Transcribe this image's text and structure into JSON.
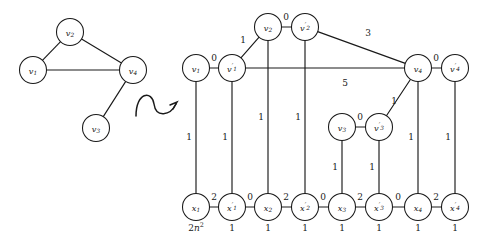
{
  "figure": {
    "background": "#ffffff",
    "ink": "#1a1a1a"
  },
  "left_graph": {
    "name": "original-graph",
    "nodes": [
      {
        "id": "v1",
        "label": "v",
        "sub": "1",
        "cx": 33,
        "cy": 70,
        "r": 13.5
      },
      {
        "id": "v2",
        "label": "v",
        "sub": "2",
        "cx": 70,
        "cy": 32,
        "r": 13.5
      },
      {
        "id": "v3",
        "label": "v",
        "sub": "3",
        "cx": 96,
        "cy": 128,
        "r": 13.5
      },
      {
        "id": "v4",
        "label": "v",
        "sub": "4",
        "cx": 133,
        "cy": 70,
        "r": 13.5
      }
    ],
    "edges": [
      {
        "from": "v1",
        "to": "v2"
      },
      {
        "from": "v2",
        "to": "v4"
      },
      {
        "from": "v1",
        "to": "v4"
      },
      {
        "from": "v3",
        "to": "v4"
      }
    ]
  },
  "arrow": {
    "name": "transformation-arrow",
    "symbol": "squiggly-arrow"
  },
  "right_graph": {
    "name": "gadget-graph",
    "nodes": [
      {
        "id": "v1",
        "label": "v",
        "sub": "1",
        "prime": false,
        "cx": 196,
        "cy": 68,
        "r": 13.5
      },
      {
        "id": "v1p",
        "label": "v",
        "sub": "1",
        "prime": true,
        "cx": 232,
        "cy": 68,
        "r": 13.5
      },
      {
        "id": "v2",
        "label": "v",
        "sub": "2",
        "prime": false,
        "cx": 268,
        "cy": 27,
        "r": 13.5
      },
      {
        "id": "v2p",
        "label": "v",
        "sub": "2",
        "prime": true,
        "cx": 305,
        "cy": 27,
        "r": 13.5
      },
      {
        "id": "v3",
        "label": "v",
        "sub": "3",
        "prime": false,
        "cx": 342,
        "cy": 127,
        "r": 13.5
      },
      {
        "id": "v3p",
        "label": "v",
        "sub": "3",
        "prime": true,
        "cx": 379,
        "cy": 127,
        "r": 13.5
      },
      {
        "id": "v4",
        "label": "v",
        "sub": "4",
        "prime": false,
        "cx": 418,
        "cy": 68,
        "r": 13.5
      },
      {
        "id": "v4p",
        "label": "v",
        "sub": "4",
        "prime": true,
        "cx": 455,
        "cy": 68,
        "r": 13.5
      },
      {
        "id": "x1",
        "label": "x",
        "sub": "1",
        "prime": false,
        "cx": 196,
        "cy": 207,
        "r": 13.5
      },
      {
        "id": "x1p",
        "label": "x",
        "sub": "1",
        "prime": true,
        "cx": 232,
        "cy": 207,
        "r": 13.5
      },
      {
        "id": "x2",
        "label": "x",
        "sub": "2",
        "prime": false,
        "cx": 268,
        "cy": 207,
        "r": 13.5
      },
      {
        "id": "x2p",
        "label": "x",
        "sub": "2",
        "prime": true,
        "cx": 305,
        "cy": 207,
        "r": 13.5
      },
      {
        "id": "x3",
        "label": "x",
        "sub": "3",
        "prime": false,
        "cx": 342,
        "cy": 207,
        "r": 13.5
      },
      {
        "id": "x3p",
        "label": "x",
        "sub": "3",
        "prime": true,
        "cx": 379,
        "cy": 207,
        "r": 13.5
      },
      {
        "id": "x4",
        "label": "x",
        "sub": "4",
        "prime": false,
        "cx": 418,
        "cy": 207,
        "r": 13.5
      },
      {
        "id": "x4p",
        "label": "x",
        "sub": "4",
        "prime": true,
        "cx": 455,
        "cy": 207,
        "r": 13.5
      }
    ],
    "edges": [
      {
        "from": "v1",
        "to": "v1p",
        "weight": "0",
        "lx": 214,
        "ly": 58
      },
      {
        "from": "v2",
        "to": "v2p",
        "weight": "0",
        "lx": 286,
        "ly": 17
      },
      {
        "from": "v3",
        "to": "v3p",
        "weight": "0",
        "lx": 360,
        "ly": 117
      },
      {
        "from": "v4",
        "to": "v4p",
        "weight": "0",
        "lx": 436,
        "ly": 58
      },
      {
        "from": "v1p",
        "to": "v2",
        "weight": "1",
        "lx": 243,
        "ly": 40
      },
      {
        "from": "v2p",
        "to": "v4",
        "weight": "3",
        "lx": 368,
        "ly": 33
      },
      {
        "from": "v1p",
        "to": "v4",
        "weight": "5",
        "lx": 345,
        "ly": 83
      },
      {
        "from": "v3p",
        "to": "v4",
        "weight": "1",
        "lx": 394,
        "ly": 101
      },
      {
        "from": "v1",
        "to": "x1",
        "weight": "1",
        "lx": 189,
        "ly": 137
      },
      {
        "from": "v1p",
        "to": "x1p",
        "weight": "1",
        "lx": 225,
        "ly": 137
      },
      {
        "from": "v2",
        "to": "x2",
        "weight": "1",
        "lx": 261,
        "ly": 117
      },
      {
        "from": "v2p",
        "to": "x2p",
        "weight": "1",
        "lx": 298,
        "ly": 117
      },
      {
        "from": "v3",
        "to": "x3",
        "weight": "1",
        "lx": 335,
        "ly": 167
      },
      {
        "from": "v3p",
        "to": "x3p",
        "weight": "1",
        "lx": 372,
        "ly": 167
      },
      {
        "from": "v4",
        "to": "x4",
        "weight": "1",
        "lx": 411,
        "ly": 137
      },
      {
        "from": "v4p",
        "to": "x4p",
        "weight": "1",
        "lx": 448,
        "ly": 137
      },
      {
        "from": "x1",
        "to": "x1p",
        "weight": "2",
        "lx": 214,
        "ly": 197
      },
      {
        "from": "x1p",
        "to": "x2",
        "weight": "0",
        "lx": 250,
        "ly": 197
      },
      {
        "from": "x2",
        "to": "x2p",
        "weight": "2",
        "lx": 286,
        "ly": 197
      },
      {
        "from": "x2p",
        "to": "x3",
        "weight": "0",
        "lx": 323,
        "ly": 197
      },
      {
        "from": "x3",
        "to": "x3p",
        "weight": "2",
        "lx": 360,
        "ly": 197
      },
      {
        "from": "x3p",
        "to": "x4",
        "weight": "0",
        "lx": 398,
        "ly": 197
      },
      {
        "from": "x4",
        "to": "x4p",
        "weight": "2",
        "lx": 436,
        "ly": 197
      }
    ],
    "node_weights": [
      {
        "node": "x1",
        "value": "2n^2",
        "display": "2n",
        "sup": "2",
        "cx": 196,
        "cy": 228
      },
      {
        "node": "x1p",
        "value": "1",
        "display": "1",
        "sup": "",
        "cx": 232,
        "cy": 228
      },
      {
        "node": "x2",
        "value": "1",
        "display": "1",
        "sup": "",
        "cx": 268,
        "cy": 228
      },
      {
        "node": "x2p",
        "value": "1",
        "display": "1",
        "sup": "",
        "cx": 305,
        "cy": 228
      },
      {
        "node": "x3",
        "value": "1",
        "display": "1",
        "sup": "",
        "cx": 342,
        "cy": 228
      },
      {
        "node": "x3p",
        "value": "1",
        "display": "1",
        "sup": "",
        "cx": 379,
        "cy": 228
      },
      {
        "node": "x4",
        "value": "1",
        "display": "1",
        "sup": "",
        "cx": 418,
        "cy": 228
      },
      {
        "node": "x4p",
        "value": "1",
        "display": "1",
        "sup": "",
        "cx": 455,
        "cy": 228
      }
    ]
  }
}
